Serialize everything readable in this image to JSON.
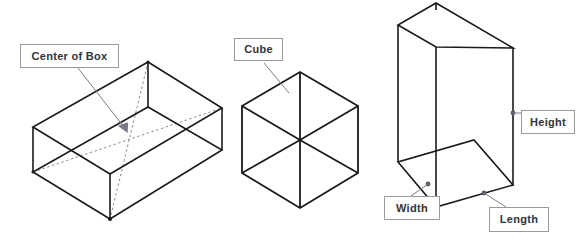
{
  "figure": {
    "background_color": "#ffffff",
    "line_color": "#1a1a1a",
    "hidden_line_color": "#8c8c8c",
    "leader_color": "#7a7a8a",
    "callout_border_color": "#9a9a9a",
    "callout_text_color": "#33333a"
  },
  "callouts": {
    "center_of_box": "Center of Box",
    "cube": "Cube",
    "height": "Height",
    "width": "Width",
    "length": "Length"
  },
  "shapes": {
    "open_box": {
      "name": "open rectangular box with diagonals to center",
      "description": "Open-top isometric rectangular box showing interior diagonals meeting at the center of the box"
    },
    "cube": {
      "name": "isometric cube",
      "description": "Hexagonal isometric cube outline with three internal edges meeting at the center"
    },
    "tall_box": {
      "name": "tall rectangular box",
      "description": "Open-top tall isometric box annotated with Height, Width and Length"
    }
  }
}
